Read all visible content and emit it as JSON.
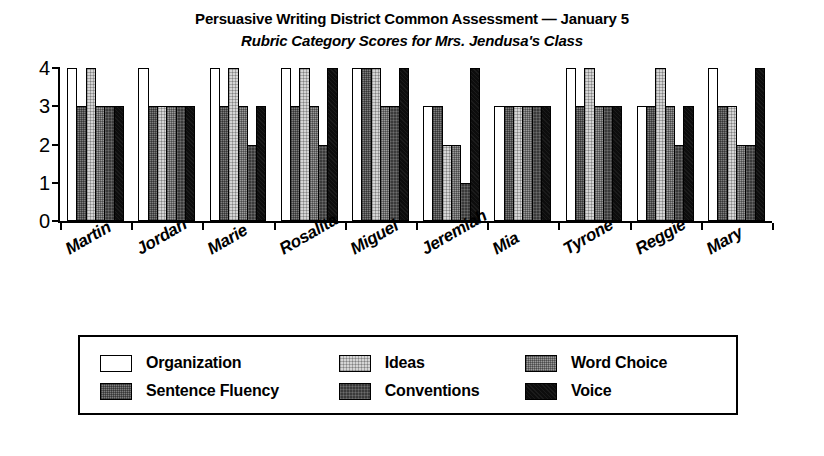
{
  "chart_data": {
    "type": "bar",
    "title": "Persuasive Writing District Common Assessment — January 5",
    "subtitle": "Rubric Category Scores for Mrs. Jendusa's Class",
    "xlabel": "",
    "ylabel": "",
    "ylim": [
      0,
      4
    ],
    "yticks": [
      0,
      1,
      2,
      3,
      4
    ],
    "ytick_labels": [
      "0",
      "1",
      "2",
      "3",
      "4"
    ],
    "grid": false,
    "legend_position": "bottom",
    "legend_layout": "3 columns x 2 rows, column-major",
    "categories": [
      "Martin",
      "Jordan",
      "Marie",
      "Rosalita",
      "Miguel",
      "Jeremiah",
      "Mia",
      "Tyrone",
      "Reggie",
      "Mary"
    ],
    "series": [
      {
        "name": "Organization",
        "color": "#ffffff",
        "values": [
          4,
          4,
          4,
          4,
          4,
          3,
          3,
          4,
          3,
          4
        ]
      },
      {
        "name": "Sentence Fluency",
        "color": "#7d7d7d",
        "values": [
          3,
          3,
          3,
          3,
          4,
          3,
          3,
          3,
          3,
          3
        ]
      },
      {
        "name": "Ideas",
        "color": "#d5d5d5",
        "values": [
          4,
          3,
          4,
          4,
          4,
          2,
          3,
          4,
          4,
          3
        ]
      },
      {
        "name": "Word Choice",
        "color": "#9a9a9a",
        "values": [
          3,
          3,
          3,
          3,
          3,
          2,
          3,
          3,
          3,
          2
        ]
      },
      {
        "name": "Conventions",
        "color": "#3a3a3a",
        "values": [
          3,
          3,
          2,
          2,
          3,
          1,
          3,
          3,
          2,
          2
        ]
      },
      {
        "name": "Voice",
        "color": "#0d0d0d",
        "values": [
          3,
          3,
          3,
          4,
          4,
          4,
          3,
          3,
          3,
          4
        ]
      }
    ]
  },
  "legend": {
    "entries": [
      {
        "label": "Organization",
        "swatch": "organization"
      },
      {
        "label": "Sentence Fluency",
        "swatch": "sentence-fluency"
      },
      {
        "label": "Ideas",
        "swatch": "ideas"
      },
      {
        "label": "Conventions",
        "swatch": "conventions"
      },
      {
        "label": "Word Choice",
        "swatch": "word-choice"
      },
      {
        "label": "Voice",
        "swatch": "voice"
      }
    ]
  }
}
